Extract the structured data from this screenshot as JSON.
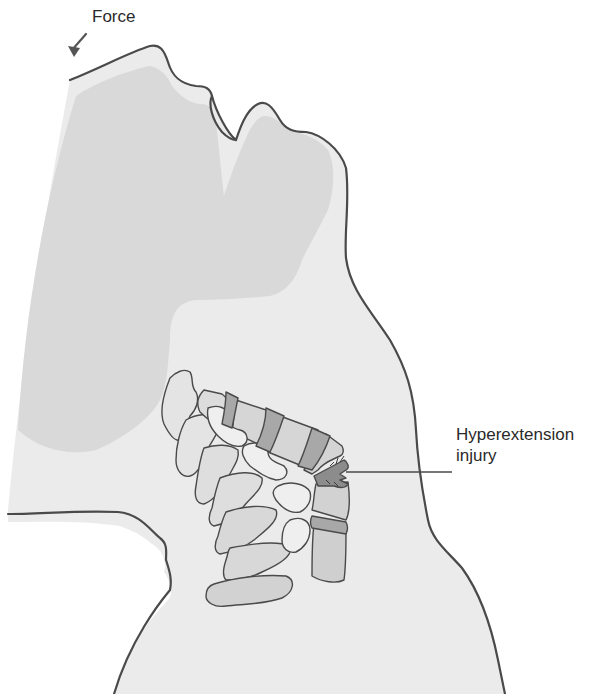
{
  "figure": {
    "colors": {
      "background": "#ffffff",
      "skin_fill": "#ebebeb",
      "deep_shade": "#d6d6d6",
      "outline": "#4a4a4a",
      "vertebra_body": "#dadada",
      "vertebra_light": "#e6e6e6",
      "disc": "#a8a8a8",
      "injured_disc": "#8c8c8c"
    }
  },
  "labels": {
    "force": "Force",
    "injury_line1": "Hyperextension",
    "injury_line2": "injury"
  },
  "annotations": [
    {
      "id": "force-arrow",
      "text": "Force",
      "points_to": "forehead",
      "direction": "down-left"
    },
    {
      "id": "injury-leader",
      "text": "Hyperextension injury",
      "points_to": "anterior cervical disc space (C5-C6 region)"
    }
  ]
}
